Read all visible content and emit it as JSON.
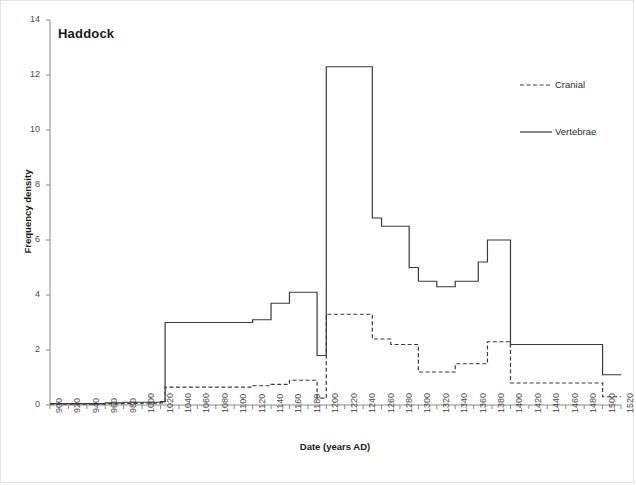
{
  "figure": {
    "title": "Haddock",
    "background": "#ffffff",
    "border_color": "#e3e3e3",
    "line_color": "#3a3a3a"
  },
  "legend": {
    "position": "top-right",
    "entries": [
      {
        "label": "Cranial",
        "style": "dashed"
      },
      {
        "label": "Vertebrae",
        "style": "solid"
      }
    ]
  },
  "chart_data": {
    "type": "line",
    "title": "Haddock",
    "xlabel": "Date (years AD)",
    "ylabel": "Frequency density",
    "xlim": [
      900,
      1520
    ],
    "ylim": [
      0,
      14
    ],
    "xticks": [
      900,
      920,
      940,
      960,
      980,
      1000,
      1020,
      1040,
      1060,
      1080,
      1100,
      1120,
      1140,
      1160,
      1180,
      1200,
      1220,
      1240,
      1260,
      1280,
      1300,
      1320,
      1340,
      1360,
      1380,
      1400,
      1420,
      1440,
      1460,
      1480,
      1500,
      1520
    ],
    "yticks": [
      0,
      2,
      4,
      6,
      8,
      10,
      12,
      14
    ],
    "grid": false,
    "legend_position": "top-right",
    "step_plot": true,
    "series": [
      {
        "name": "Vertebrae",
        "style": "solid",
        "color": "#3a3a3a",
        "x": [
          900,
          960,
          980,
          1000,
          1020,
          1025,
          1040,
          1100,
          1120,
          1140,
          1160,
          1180,
          1190,
          1200,
          1240,
          1250,
          1260,
          1280,
          1290,
          1300,
          1320,
          1340,
          1355,
          1365,
          1375,
          1380,
          1400,
          1490,
          1500,
          1520
        ],
        "values": [
          0.05,
          0.08,
          0.1,
          0.1,
          0.12,
          3.0,
          3.0,
          3.0,
          3.1,
          3.7,
          4.1,
          4.1,
          1.8,
          12.3,
          12.3,
          6.8,
          6.5,
          6.5,
          5.0,
          4.5,
          4.3,
          4.5,
          4.5,
          5.2,
          6.0,
          6.0,
          2.2,
          2.2,
          1.1,
          1.1
        ]
      },
      {
        "name": "Cranial",
        "style": "dashed",
        "color": "#3a3a3a",
        "x": [
          900,
          960,
          980,
          1000,
          1020,
          1025,
          1040,
          1100,
          1120,
          1140,
          1160,
          1175,
          1190,
          1200,
          1240,
          1250,
          1270,
          1280,
          1300,
          1320,
          1340,
          1360,
          1375,
          1380,
          1400,
          1490,
          1500,
          1520
        ],
        "values": [
          0.03,
          0.05,
          0.06,
          0.07,
          0.08,
          0.65,
          0.65,
          0.65,
          0.7,
          0.75,
          0.9,
          0.9,
          0.25,
          3.3,
          3.3,
          2.4,
          2.2,
          2.2,
          1.2,
          1.2,
          1.5,
          1.5,
          2.3,
          2.3,
          0.8,
          0.8,
          0.3,
          0.3
        ]
      }
    ]
  }
}
